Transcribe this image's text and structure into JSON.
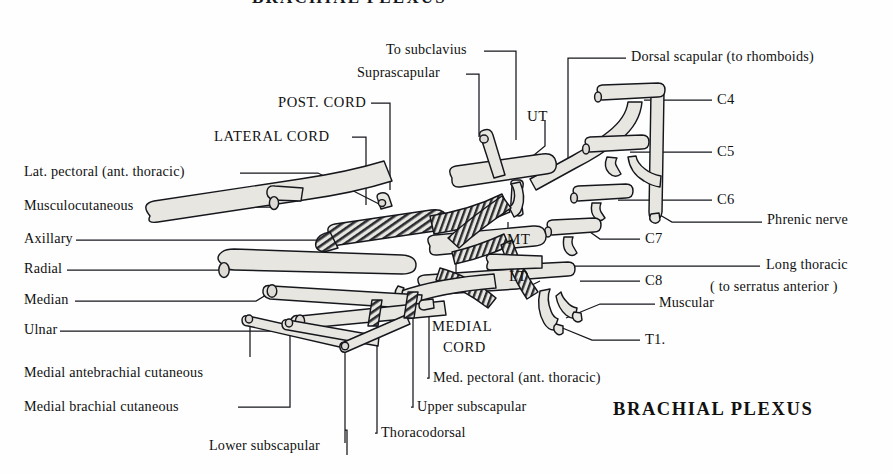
{
  "figure": {
    "title_top": "BRACHIAL PLEXUS",
    "title_main": "BRACHIAL  PLEXUS",
    "background_color": "#fefefe",
    "nerve_fill_color": "#e8e6e1",
    "outline_color": "#15171c"
  },
  "labels": {
    "to_subclavius": "To subclavius",
    "suprascapular": "Suprascapular",
    "post_cord": "POST. CORD",
    "lateral_cord": "LATERAL CORD",
    "lat_pectoral": "Lat. pectoral (ant. thoracic)",
    "musculocutaneous": "Musculocutaneous",
    "axillary": "Axillary",
    "radial": "Radial",
    "median": "Median",
    "ulnar": "Ulnar",
    "medial_antebrachial_cutaneous": "Medial antebrachial cutaneous",
    "medial_brachial_cutaneous": "Medial brachial cutaneous",
    "lower_subscapular": "Lower subscapular",
    "thoracodorsal": "Thoracodorsal",
    "upper_subscapular": "Upper subscapular",
    "med_pectoral": "Med. pectoral (ant. thoracic)",
    "medial_cord_line1": "MEDIAL",
    "medial_cord_line2": "CORD",
    "dorsal_scapular": "Dorsal scapular (to rhomboids)",
    "phrenic_nerve": "Phrenic nerve",
    "long_thoracic_line1": "Long thoracic",
    "long_thoracic_line2": "( to serratus anterior )",
    "muscular": "Muscular",
    "upper_trunk": "UT",
    "middle_trunk": "MT",
    "lower_trunk": "LT",
    "c4": "C4",
    "c5": "C5",
    "c6": "C6",
    "c7": "C7",
    "c8": "C8",
    "t1": "T1."
  }
}
